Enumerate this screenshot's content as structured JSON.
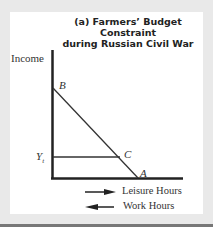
{
  "title_line1": "(a) Farmers’ Budget Constraint",
  "title_line2": "during Russian Civil War",
  "y_axis_label": "Income",
  "points": {
    "B": "B",
    "C": "C",
    "A": "A"
  },
  "yt_label": "Y",
  "yt_subscript": "t",
  "legend": {
    "right_arrow_label": "Leisure Hours",
    "left_arrow_label": "Work Hours"
  },
  "colors": {
    "line": "#222222",
    "background": "#e9e9e9",
    "panel": "#ffffff"
  }
}
